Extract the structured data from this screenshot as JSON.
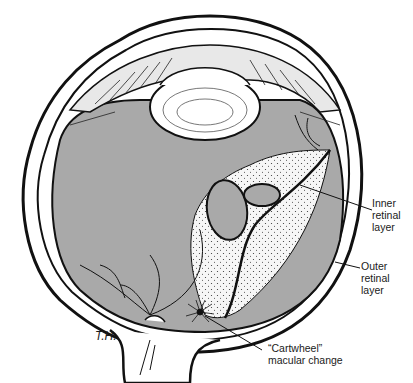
{
  "figure": {
    "colors": {
      "fill_gray": "#a9a9a9",
      "line": "#111111",
      "background": "#ffffff",
      "stipple_area": "#f4f4f4"
    },
    "labels": {
      "inner_retinal_layer": [
        "Inner",
        "retinal",
        "layer"
      ],
      "outer_retinal_layer": [
        "Outer",
        "retinal",
        "layer"
      ],
      "cartwheel": [
        "“Cartwheel”",
        "macular change"
      ]
    },
    "signature": "T.H."
  }
}
